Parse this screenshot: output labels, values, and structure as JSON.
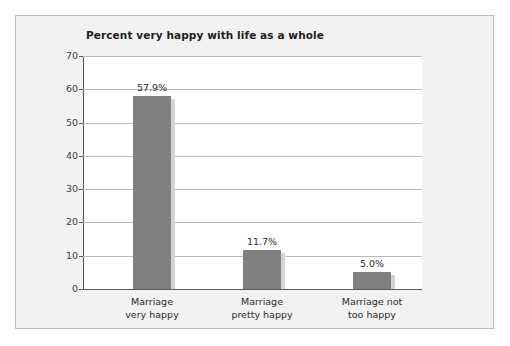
{
  "chart_data": {
    "type": "bar",
    "title": "Percent very happy with life as a whole",
    "xlabel": "",
    "ylabel": "",
    "categories": [
      "Marriage very happy",
      "Marriage pretty happy",
      "Marriage not too happy"
    ],
    "category_lines": [
      [
        "Marriage",
        "very happy"
      ],
      [
        "Marriage",
        "pretty happy"
      ],
      [
        "Marriage not",
        "too happy"
      ]
    ],
    "values": [
      57.9,
      11.7,
      5.0
    ],
    "value_labels": [
      "57.9%",
      "11.7%",
      "5.0%"
    ],
    "ylim": [
      0,
      70
    ],
    "yticks": [
      0,
      10,
      20,
      30,
      40,
      50,
      60,
      70
    ],
    "ytick_labels": [
      "0",
      "10",
      "20",
      "30",
      "40",
      "50",
      "60",
      "70"
    ],
    "grid": true,
    "legend": null,
    "bar_color": "#808080",
    "plot_background": "#ffffff",
    "panel_background": "#f2f2f2",
    "panel_border_color": "#bcbcbc"
  }
}
